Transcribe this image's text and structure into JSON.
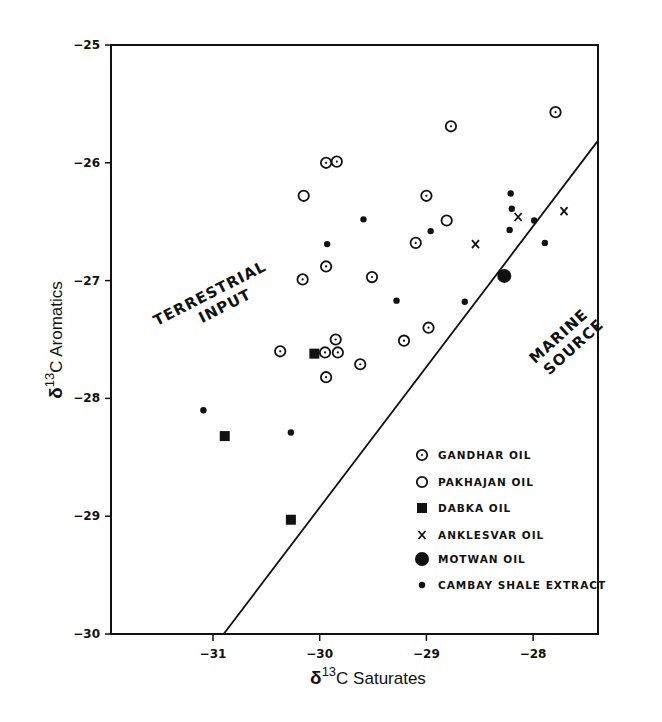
{
  "chart_data": {
    "type": "scatter",
    "title": "",
    "xlabel": "δ13C Saturates",
    "ylabel": "δ13C Aromatics",
    "xlim": [
      -32.0,
      -27.4
    ],
    "ylim": [
      -30,
      -25
    ],
    "xticks": [
      -31,
      -30,
      -29,
      -28
    ],
    "yticks": [
      -25,
      -26,
      -27,
      -28,
      -29,
      -30
    ],
    "grid": false,
    "legend_position": "lower right (inside)",
    "divider_line": {
      "from": [
        -30.9,
        -30.0
      ],
      "to": [
        -27.39,
        -25.81
      ]
    },
    "annotations": [
      {
        "text": [
          "TERRESTRIAL",
          "INPUT"
        ],
        "region": "upper-left of line"
      },
      {
        "text": [
          "MARINE",
          "SOURCE"
        ],
        "region": "lower-right of line"
      }
    ],
    "series": [
      {
        "name": "GANDHAR OIL",
        "marker": "dotted-circle",
        "points": [
          [
            -27.79,
            -25.57
          ],
          [
            -28.77,
            -25.69
          ],
          [
            -29.94,
            -26.0
          ],
          [
            -29.84,
            -25.99
          ],
          [
            -29.0,
            -26.28
          ],
          [
            -29.1,
            -26.68
          ],
          [
            -30.16,
            -26.99
          ],
          [
            -29.94,
            -26.88
          ],
          [
            -29.51,
            -26.97
          ],
          [
            -28.98,
            -27.4
          ],
          [
            -29.21,
            -27.51
          ],
          [
            -29.85,
            -27.5
          ],
          [
            -30.37,
            -27.6
          ],
          [
            -29.95,
            -27.61
          ],
          [
            -29.83,
            -27.61
          ],
          [
            -29.62,
            -27.71
          ],
          [
            -29.94,
            -27.82
          ]
        ]
      },
      {
        "name": "PAKHAJAN OIL",
        "marker": "open-circle",
        "points": [
          [
            -30.15,
            -26.28
          ],
          [
            -28.81,
            -26.49
          ]
        ]
      },
      {
        "name": "DABKA OIL",
        "marker": "filled-square",
        "points": [
          [
            -30.05,
            -27.62
          ],
          [
            -30.89,
            -28.32
          ],
          [
            -30.27,
            -29.03
          ]
        ]
      },
      {
        "name": "ANKLESVAR OIL",
        "marker": "x",
        "points": [
          [
            -28.54,
            -26.69
          ],
          [
            -28.14,
            -26.46
          ],
          [
            -27.71,
            -26.41
          ]
        ]
      },
      {
        "name": "MOTWAN OIL",
        "marker": "large-filled-circle",
        "points": [
          [
            -28.27,
            -26.96
          ]
        ]
      },
      {
        "name": "CAMBAY SHALE EXTRACT",
        "marker": "small-filled-circle",
        "points": [
          [
            -29.59,
            -26.48
          ],
          [
            -28.96,
            -26.58
          ],
          [
            -29.93,
            -26.69
          ],
          [
            -28.21,
            -26.26
          ],
          [
            -28.2,
            -26.39
          ],
          [
            -27.99,
            -26.49
          ],
          [
            -28.22,
            -26.57
          ],
          [
            -27.89,
            -26.68
          ],
          [
            -29.28,
            -27.17
          ],
          [
            -28.64,
            -27.18
          ],
          [
            -31.09,
            -28.1
          ],
          [
            -30.27,
            -28.29
          ]
        ]
      }
    ]
  },
  "axes": {
    "x_title_prefix": "δ",
    "x_title_sup": "13",
    "x_title_rest": "C Saturates",
    "y_title_prefix": "δ",
    "y_title_sup": "13",
    "y_title_rest": "C Aromatics"
  },
  "labels": {
    "terrestrial_1": "TERRESTRIAL",
    "terrestrial_2": "INPUT",
    "marine_1": "MARINE",
    "marine_2": "SOURCE"
  },
  "legend": [
    {
      "label": "GANDHAR OIL",
      "marker": "dotted-circle"
    },
    {
      "label": "PAKHAJAN OIL",
      "marker": "open-circle"
    },
    {
      "label": "DABKA OIL",
      "marker": "filled-square"
    },
    {
      "label": "ANKLESVAR OIL",
      "marker": "x"
    },
    {
      "label": "MOTWAN OIL",
      "marker": "large-filled-circle"
    },
    {
      "label": "CAMBAY SHALE EXTRACT",
      "marker": "small-filled-circle"
    }
  ],
  "colors": {
    "ink": "#111111",
    "background": "#ffffff"
  }
}
